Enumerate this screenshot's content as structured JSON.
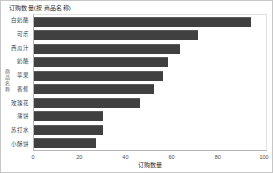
{
  "chart": {
    "title": "订购数量(按 商品名称)",
    "xlabel": "订购数量",
    "ylabel": "商品名称"
  },
  "chart_data": {
    "type": "bar",
    "orientation": "horizontal",
    "title": "订购数量(按 商品名称)",
    "xlabel": "订购数量",
    "ylabel": "商品名称",
    "categories": [
      "白奶酪",
      "可乐",
      "西瓜汁",
      "奶酪",
      "苹果",
      "香蕉",
      "玫瑰花",
      "薄饼",
      "苏打水",
      "小酥饼"
    ],
    "values": [
      94,
      71,
      63,
      58,
      56,
      52,
      46,
      30,
      30,
      27
    ],
    "xlim": [
      0,
      100
    ],
    "xticks": [
      0,
      20,
      40,
      60,
      80,
      100
    ],
    "grid": false,
    "legend": false,
    "sort": "descending",
    "bar_color": "#404040"
  },
  "colors": {
    "bar": "#404040",
    "card_border": "#c6c6c6",
    "axis_line": "#b5b5b5",
    "plot_border": "#e2e2e2",
    "text": "#2b2b2b",
    "background": "#ffffff"
  }
}
